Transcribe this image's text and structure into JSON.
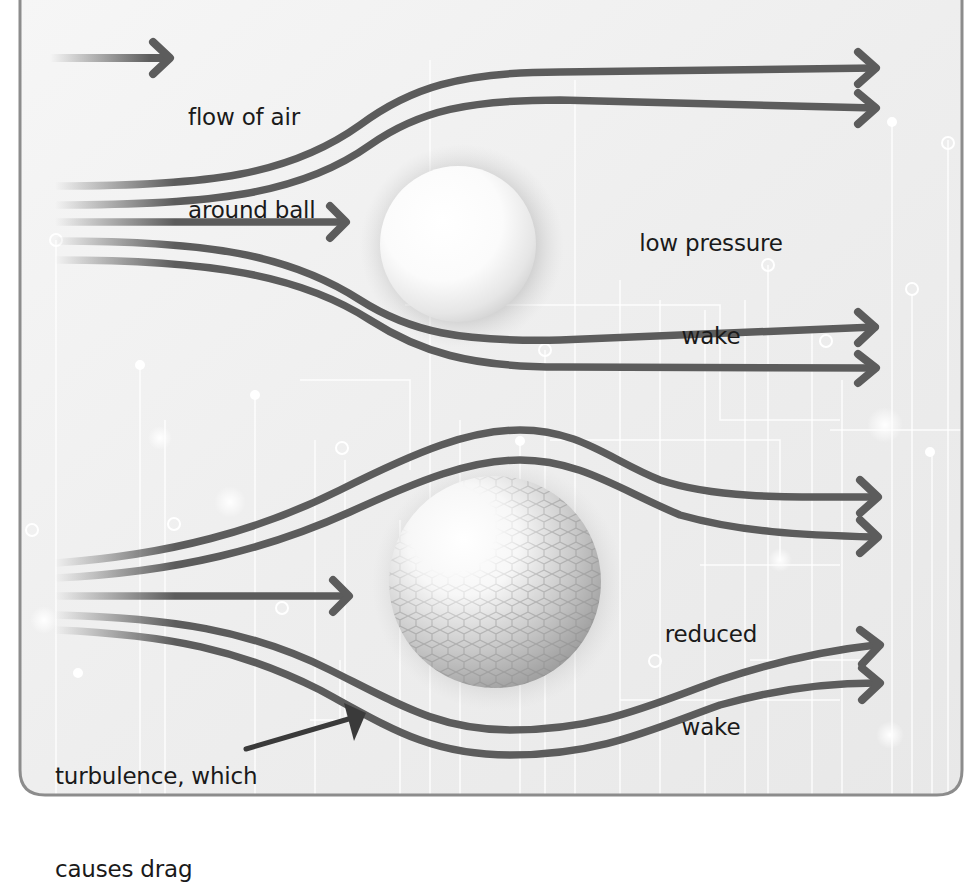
{
  "diagram": {
    "title_fragment": "",
    "colors": {
      "background": "#efefef",
      "frame_border": "#8c8c8c",
      "stream": "#5c5c5c",
      "text": "#1a1a1a",
      "circuit": "#ffffff"
    },
    "legend": {
      "line1": "flow of air",
      "line2": "around ball"
    },
    "top_panel": {
      "ball_type": "smooth ball",
      "wake_label_line1": "low pressure",
      "wake_label_line2": "wake"
    },
    "bottom_panel": {
      "ball_type": "dimpled golf ball",
      "wake_label_line1": "reduced",
      "wake_label_line2": "wake",
      "turbulence_label_line1": "turbulence, which",
      "turbulence_label_line2": "causes drag"
    }
  }
}
